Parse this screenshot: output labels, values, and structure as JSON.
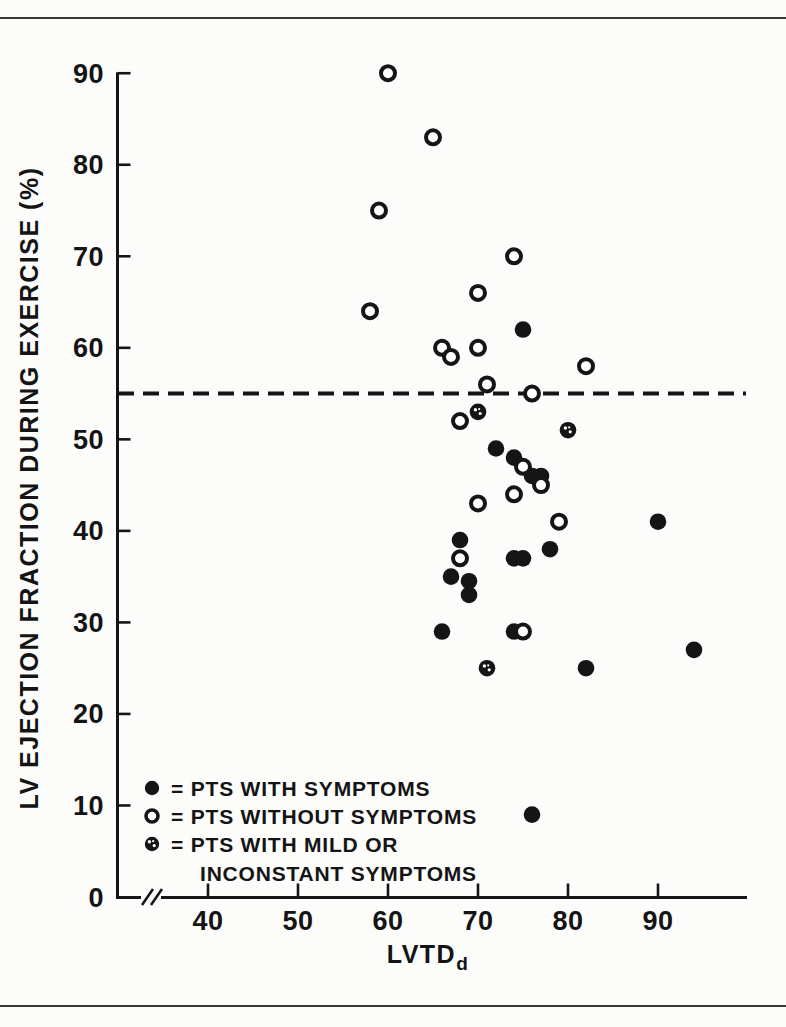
{
  "figure": {
    "background_color": "#fcfcfb",
    "rule_color": "#3a3a38",
    "marker_color": "#151515"
  },
  "chart_data": {
    "type": "scatter",
    "title": "",
    "xlabel_main": "LVTD",
    "xlabel_sub": "d",
    "ylabel": "LV EJECTION FRACTION DURING EXERCISE (%)",
    "xlim": [
      33,
      100
    ],
    "ylim": [
      0,
      90
    ],
    "xticks": [
      40,
      50,
      60,
      70,
      80,
      90
    ],
    "yticks": [
      0,
      10,
      20,
      30,
      40,
      50,
      60,
      70,
      80,
      90
    ],
    "x_axis_break": true,
    "grid": false,
    "threshold_line": {
      "y": 55,
      "style": "dashed"
    },
    "series": [
      {
        "name": "PTS WITH SYMPTOMS",
        "marker": "filled",
        "points": [
          [
            75,
            62
          ],
          [
            72,
            49
          ],
          [
            74,
            48
          ],
          [
            76,
            46
          ],
          [
            77,
            46
          ],
          [
            90,
            41
          ],
          [
            68,
            39
          ],
          [
            78,
            38
          ],
          [
            74,
            37
          ],
          [
            75,
            37
          ],
          [
            67,
            35
          ],
          [
            69,
            34.5
          ],
          [
            69,
            33
          ],
          [
            66,
            29
          ],
          [
            74,
            29
          ],
          [
            94,
            27
          ],
          [
            82,
            25
          ],
          [
            76,
            9
          ]
        ]
      },
      {
        "name": "PTS WITHOUT SYMPTOMS",
        "marker": "open",
        "points": [
          [
            60,
            90
          ],
          [
            65,
            83
          ],
          [
            59,
            75
          ],
          [
            74,
            70
          ],
          [
            70,
            66
          ],
          [
            58,
            64
          ],
          [
            66,
            60
          ],
          [
            70,
            60
          ],
          [
            67,
            59
          ],
          [
            82,
            58
          ],
          [
            71,
            56
          ],
          [
            76,
            55
          ],
          [
            68,
            52
          ],
          [
            75,
            47
          ],
          [
            77,
            45
          ],
          [
            74,
            44
          ],
          [
            70,
            43
          ],
          [
            79,
            41
          ],
          [
            68,
            37
          ],
          [
            75,
            29
          ]
        ]
      },
      {
        "name": "PTS WITH MILD OR INCONSTANT SYMPTOMS",
        "marker": "half-filled",
        "points": [
          [
            70,
            53
          ],
          [
            80,
            51
          ],
          [
            71,
            25
          ]
        ]
      }
    ],
    "legend": {
      "position": "lower-left",
      "items": [
        {
          "symbol": "filled-circle",
          "label": "= PTS WITH SYMPTOMS"
        },
        {
          "symbol": "open-circle",
          "label": "= PTS WITHOUT SYMPTOMS"
        },
        {
          "symbol": "half-filled-circle",
          "label": "= PTS WITH MILD OR",
          "label2": "INCONSTANT SYMPTOMS"
        }
      ]
    }
  }
}
